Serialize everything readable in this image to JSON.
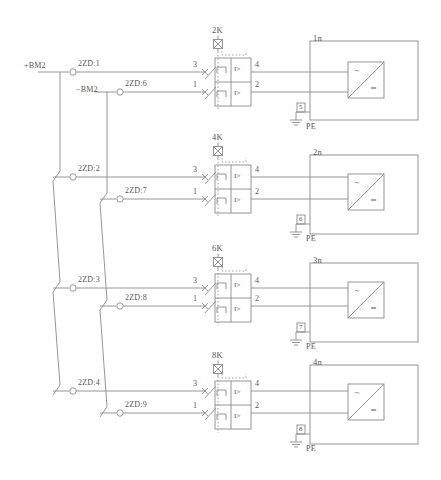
{
  "diagram": {
    "line_color": "#8a8a8a",
    "text_color": "#555555"
  },
  "supply": {
    "positive_label": "+BM2",
    "negative_label": "−BM2"
  },
  "terminals": {
    "positive": [
      {
        "name": "2ZD:1",
        "x": 73,
        "y": 72
      },
      {
        "name": "2ZD:2",
        "x": 73,
        "y": 177
      },
      {
        "name": "2ZD:3",
        "x": 73,
        "y": 288
      },
      {
        "name": "2ZD:4",
        "x": 73,
        "y": 391
      }
    ],
    "negative": [
      {
        "name": "2ZD:6",
        "x": 120,
        "y": 92
      },
      {
        "name": "2ZD:7",
        "x": 120,
        "y": 199
      },
      {
        "name": "2ZD:8",
        "x": 120,
        "y": 306
      },
      {
        "name": "2ZD:9",
        "x": 120,
        "y": 413
      }
    ]
  },
  "breakers": [
    {
      "name": "2K",
      "label_x": 212,
      "label_y": 26,
      "trip_x": 218,
      "trip_y": 44,
      "body_x": 215,
      "body_y": 58,
      "body_w": 36,
      "body_h": 48,
      "contacts": [
        {
          "terminal_in": "3",
          "terminal_out": "4",
          "y": 72
        },
        {
          "terminal_in": "1",
          "terminal_out": "2",
          "y": 92
        }
      ]
    },
    {
      "name": "4K",
      "label_x": 212,
      "label_y": 133,
      "trip_x": 218,
      "trip_y": 151,
      "body_x": 215,
      "body_y": 165,
      "body_w": 36,
      "body_h": 48,
      "contacts": [
        {
          "terminal_in": "3",
          "terminal_out": "4",
          "y": 177
        },
        {
          "terminal_in": "1",
          "terminal_out": "2",
          "y": 199
        }
      ]
    },
    {
      "name": "6K",
      "label_x": 212,
      "label_y": 244,
      "trip_x": 218,
      "trip_y": 262,
      "body_x": 215,
      "body_y": 274,
      "body_w": 36,
      "body_h": 48,
      "contacts": [
        {
          "terminal_in": "3",
          "terminal_out": "4",
          "y": 288
        },
        {
          "terminal_in": "1",
          "terminal_out": "2",
          "y": 306
        }
      ]
    },
    {
      "name": "8K",
      "label_x": 212,
      "label_y": 351,
      "trip_x": 218,
      "trip_y": 369,
      "body_x": 215,
      "body_y": 381,
      "body_w": 36,
      "body_h": 48,
      "contacts": [
        {
          "terminal_in": "3",
          "terminal_out": "4",
          "y": 391
        },
        {
          "terminal_in": "1",
          "terminal_out": "2",
          "y": 413
        }
      ]
    }
  ],
  "modules": [
    {
      "name": "1n",
      "label_x": 313,
      "label_y": 34,
      "box_x": 310,
      "box_y": 41,
      "box_w": 108,
      "box_h": 79,
      "rect_x": 348,
      "rect_y": 62,
      "rect_w": 36,
      "rect_h": 36,
      "ac_symbol": "∼",
      "dc_symbol": "═",
      "pe_number": "5",
      "pe_label": "PE",
      "pe_x": 296,
      "pe_y": 112
    },
    {
      "name": "2n",
      "label_x": 313,
      "label_y": 148,
      "box_x": 310,
      "box_y": 155,
      "box_w": 108,
      "box_h": 79,
      "rect_x": 348,
      "rect_y": 174,
      "rect_w": 36,
      "rect_h": 36,
      "ac_symbol": "∼",
      "dc_symbol": "═",
      "pe_number": "6",
      "pe_label": "PE",
      "pe_x": 296,
      "pe_y": 224
    },
    {
      "name": "3n",
      "label_x": 313,
      "label_y": 256,
      "box_x": 310,
      "box_y": 263,
      "box_w": 108,
      "box_h": 79,
      "rect_x": 348,
      "rect_y": 282,
      "rect_w": 36,
      "rect_h": 36,
      "ac_symbol": "∼",
      "dc_symbol": "═",
      "pe_number": "7",
      "pe_label": "PE",
      "pe_x": 296,
      "pe_y": 332
    },
    {
      "name": "4n",
      "label_x": 313,
      "label_y": 358,
      "box_x": 310,
      "box_y": 365,
      "box_w": 108,
      "box_h": 79,
      "rect_x": 348,
      "rect_y": 384,
      "rect_w": 36,
      "rect_h": 36,
      "ac_symbol": "∼",
      "dc_symbol": "═",
      "pe_number": "8",
      "pe_label": "PE",
      "pe_x": 296,
      "pe_y": 434
    }
  ],
  "relay_marking": "I>",
  "bus": {
    "positive_x": 60,
    "negative_x": 107
  }
}
